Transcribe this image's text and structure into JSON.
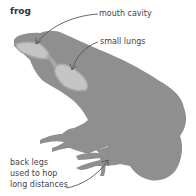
{
  "diagram": {
    "title": "frog",
    "labels": {
      "mouth_cavity": "mouth cavity",
      "small_lungs": "small lungs",
      "back_legs_line1": "back legs",
      "back_legs_line2": "used to hop",
      "back_legs_line3": "long distances"
    },
    "colors": {
      "body": "#8f8f8f",
      "organ": "#c4c4c4",
      "organ_outline": "#a8a8a8",
      "arrow": "#555555",
      "text": "#444444"
    }
  }
}
